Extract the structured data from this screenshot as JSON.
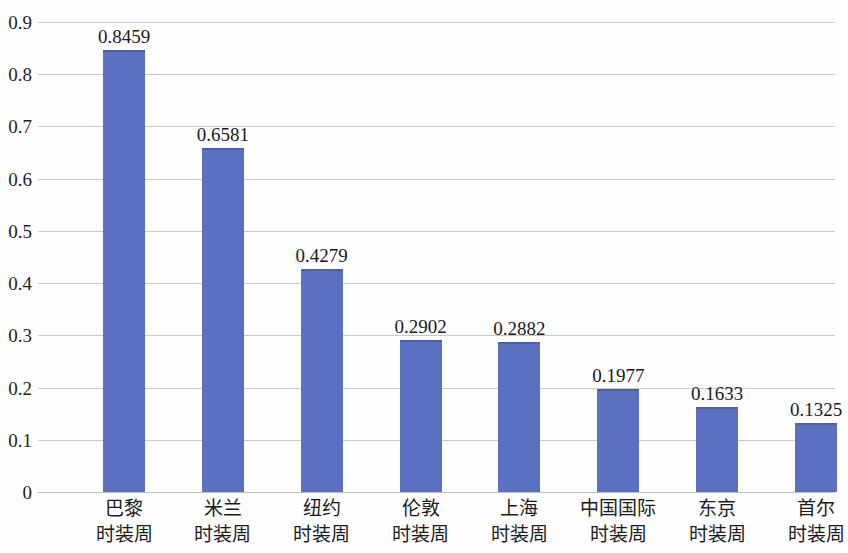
{
  "chart_data": {
    "type": "bar",
    "title": "",
    "subtitle": "",
    "xlabel": "",
    "ylabel": "",
    "categories": [
      "巴黎\n时装周",
      "米兰\n时装周",
      "纽约\n时装周",
      "伦敦\n时装周",
      "上海\n时装周",
      "中国国际\n时装周",
      "东京\n时装周",
      "首尔\n时装周"
    ],
    "category_lines": [
      [
        "巴黎",
        "时装周"
      ],
      [
        "米兰",
        "时装周"
      ],
      [
        "纽约",
        "时装周"
      ],
      [
        "伦敦",
        "时装周"
      ],
      [
        "上海",
        "时装周"
      ],
      [
        "中国国际",
        "时装周"
      ],
      [
        "东京",
        "时装周"
      ],
      [
        "首尔",
        "时装周"
      ]
    ],
    "values": [
      0.8459,
      0.6581,
      0.4279,
      0.2902,
      0.2882,
      0.1977,
      0.1633,
      0.1325
    ],
    "value_labels": [
      "0.8459",
      "0.6581",
      "0.4279",
      "0.2902",
      "0.2882",
      "0.1977",
      "0.1633",
      "0.1325"
    ],
    "ylim": [
      0,
      0.9
    ],
    "ytick_values": [
      0.9,
      0.8,
      0.7,
      0.6,
      0.5,
      0.4,
      0.3,
      0.2,
      0.1,
      0
    ],
    "ytick_labels": [
      "0.9",
      "0.8",
      "0.7",
      "0.6",
      "0.5",
      "0.4",
      "0.3",
      "0.2",
      "0.1",
      "0"
    ],
    "grid": true,
    "legend": null,
    "legend_position": "none",
    "series": [
      {
        "name": "",
        "color": "#5b70c0",
        "values": [
          0.8459,
          0.6581,
          0.4279,
          0.2902,
          0.2882,
          0.1977,
          0.1633,
          0.1325
        ]
      }
    ],
    "colors": {
      "bar": "#5b70c0",
      "bar_top_edge": "#4a5fae",
      "gridline": "#c9c9c9",
      "baseline": "#bdbdbd",
      "text": "#1a1a1a",
      "background": "#fefefe"
    }
  }
}
